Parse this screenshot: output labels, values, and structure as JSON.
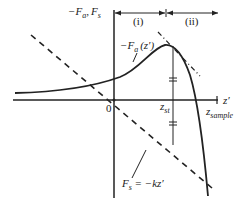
{
  "figure": {
    "y_axis_label": {
      "minus": "−",
      "Fa": "F",
      "a_sub": "a",
      "sep": ",",
      "Fs": "F",
      "s_sub": "s"
    },
    "x_axis_label": "z′",
    "origin_label": "0",
    "region_i": "(i)",
    "region_ii": "(ii)",
    "curve_label": {
      "prefix": "−F",
      "sub": "a",
      "arg": "(z′)"
    },
    "zst_label": {
      "z": "z",
      "sub": "st"
    },
    "zsample_label": {
      "z": "z",
      "sub": "sample"
    },
    "spring_label": {
      "F": "F",
      "sub": "s",
      "eq": " = −kz′"
    },
    "colors": {
      "line": "#222222",
      "background": "#ffffff"
    }
  }
}
